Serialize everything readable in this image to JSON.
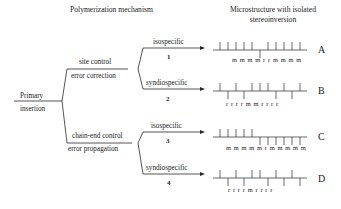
{
  "headers": {
    "mechanism": "Polymerization mechanism",
    "microstructure_line1": "Microstructure with isolated",
    "microstructure_line2": "stereoinversion"
  },
  "root": {
    "label_top": "Primary",
    "label_bottom": "insertion"
  },
  "branches": [
    {
      "label_top": "site control",
      "label_bottom": "error correction",
      "paths": [
        {
          "label": "isospecific",
          "number": "1",
          "result": "A",
          "sequence": "m m m m r r m m m m",
          "ticks": [
            "u",
            "u",
            "u",
            "u",
            "u",
            "d",
            "u",
            "u",
            "u",
            "u",
            "u"
          ]
        },
        {
          "label": "syndiospecific",
          "number": "2",
          "result": "B",
          "sequence": "r r r r m m r r r r",
          "ticks": [
            "u",
            "d",
            "u",
            "d",
            "u",
            "u",
            "u",
            "d",
            "u",
            "d",
            "u"
          ]
        }
      ]
    },
    {
      "label_top": "chain-end control",
      "label_bottom": "error propagation",
      "paths": [
        {
          "label": "isospecific",
          "number": "3",
          "result": "C",
          "sequence": "m m m m m r m m m m m",
          "ticks": [
            "u",
            "u",
            "u",
            "u",
            "u",
            "d",
            "d",
            "d",
            "d",
            "d",
            "d"
          ]
        },
        {
          "label": "syndiospecific",
          "number": "4",
          "result": "D",
          "sequence": "r r r r m r r r r",
          "ticks": [
            "u",
            "d",
            "u",
            "d",
            "u",
            "u",
            "d",
            "u",
            "d",
            "u",
            "d"
          ]
        }
      ]
    }
  ],
  "colors": {
    "line": "#2a2a2a",
    "text": "#1a1a1a"
  }
}
